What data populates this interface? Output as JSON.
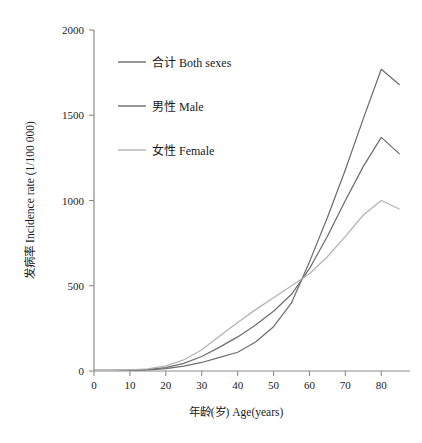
{
  "chart_data": {
    "type": "line",
    "title": "",
    "xlabel": "年龄(岁) Age(years)",
    "ylabel": "发病率 Incidence rate (1/100 000)",
    "xlim": [
      0,
      88
    ],
    "ylim": [
      0,
      2000
    ],
    "grid": false,
    "legend_position": "upper-left-inside",
    "x_ticks": [
      0,
      10,
      20,
      30,
      40,
      50,
      60,
      70,
      80
    ],
    "x_tick_labels": [
      "0",
      "10",
      "20",
      "30",
      "40",
      "50",
      "60",
      "70",
      "80"
    ],
    "y_ticks": [
      0,
      500,
      1000,
      1500,
      2000
    ],
    "y_tick_labels": [
      "0",
      "500",
      "1000",
      "1500",
      "2000"
    ],
    "x": [
      0,
      5,
      10,
      15,
      20,
      25,
      30,
      35,
      40,
      45,
      50,
      55,
      60,
      65,
      70,
      75,
      80,
      85
    ],
    "series": [
      {
        "name": "合计 Both sexes",
        "color": "#6e6e6e",
        "values": [
          3,
          3,
          5,
          9,
          20,
          45,
          85,
          140,
          200,
          270,
          350,
          450,
          600,
          790,
          1000,
          1200,
          1370,
          1275
        ]
      },
      {
        "name": "男性 Male",
        "color": "#6e6e6e",
        "values": [
          3,
          3,
          4,
          7,
          14,
          28,
          50,
          80,
          110,
          170,
          260,
          400,
          640,
          900,
          1180,
          1480,
          1770,
          1680
        ]
      },
      {
        "name": "女性 Female",
        "color": "#b3b3b3",
        "values": [
          3,
          4,
          7,
          13,
          30,
          65,
          125,
          205,
          285,
          360,
          430,
          500,
          570,
          670,
          790,
          915,
          1000,
          950
        ]
      }
    ]
  },
  "legend": {
    "items": [
      {
        "label": "合计 Both sexes",
        "color": "#6e6e6e"
      },
      {
        "label": "男性 Male",
        "color": "#6e6e6e"
      },
      {
        "label": "女性 Female",
        "color": "#b3b3b3"
      }
    ]
  },
  "axes": {
    "x_title": "年龄(岁) Age(years)",
    "y_title": "发病率 Incidence rate (1/100 000)"
  }
}
